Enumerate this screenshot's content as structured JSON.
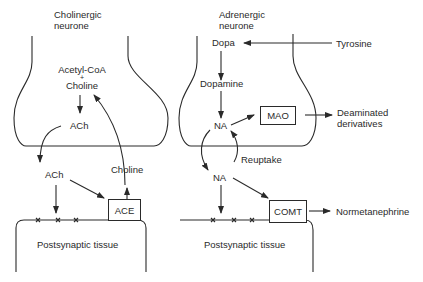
{
  "cholinergic": {
    "title_line1": "Cholinergic",
    "title_line2": "neurone",
    "precursor_line1": "Acetyl-CoA",
    "plus": "+",
    "precursor_line2": "Choline",
    "ach_inside": "ACh",
    "ach_cleft": "ACh",
    "choline_return": "Choline",
    "enzyme": "ACE",
    "postsynaptic": "Postsynaptic tissue"
  },
  "adrenergic": {
    "title_line1": "Adrenergic",
    "title_line2": "neurone",
    "dopa": "Dopa",
    "tyrosine": "Tyrosine",
    "dopamine": "Dopamine",
    "na_inside": "NA",
    "mao": "MAO",
    "deaminated_line1": "Deaminated",
    "deaminated_line2": "derivatives",
    "reuptake": "Reuptake",
    "na_cleft": "NA",
    "comt": "COMT",
    "normetanephrine": "Normetanephrine",
    "postsynaptic": "Postsynaptic tissue"
  },
  "colors": {
    "line": "#2a2a2a",
    "background": "#ffffff"
  }
}
